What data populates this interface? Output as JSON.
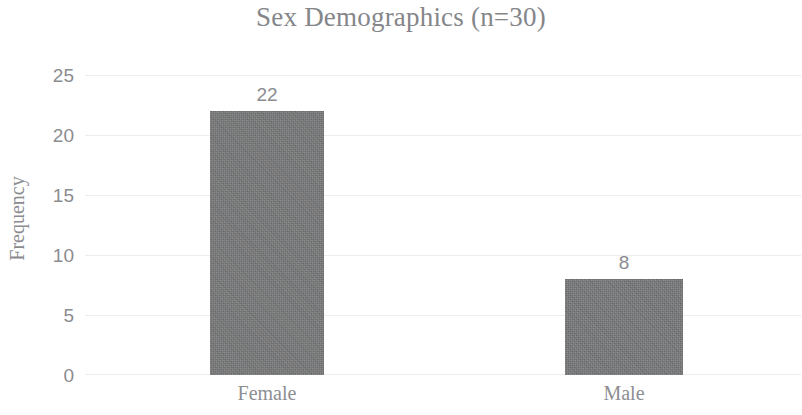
{
  "chart_data": {
    "type": "bar",
    "title": "Sex Demographics (n=30)",
    "xlabel": "",
    "ylabel": "Frequency",
    "categories": [
      "Female",
      "Male"
    ],
    "values": [
      22,
      8
    ],
    "data_labels": [
      "22",
      "8"
    ],
    "ylim": [
      0,
      25
    ],
    "yticks": [
      0,
      5,
      10,
      15,
      20,
      25
    ],
    "ytick_labels": [
      "0",
      "5",
      "10",
      "15",
      "20",
      "25"
    ],
    "grid": "horizontal",
    "legend": "none",
    "bar_color": "#777879",
    "text_color": "#8b8c90",
    "gridline_color": "#ededee",
    "background_color": "#ffffff"
  },
  "ticks": {
    "y": [
      {
        "label": "25",
        "value": 25
      },
      {
        "label": "20",
        "value": 20
      },
      {
        "label": "15",
        "value": 15
      },
      {
        "label": "10",
        "value": 10
      },
      {
        "label": "5",
        "value": 5
      },
      {
        "label": "0",
        "value": 0
      }
    ]
  },
  "bars": [
    {
      "category": "Female",
      "value": 22,
      "label": "22"
    },
    {
      "category": "Male",
      "value": 8,
      "label": "8"
    }
  ]
}
